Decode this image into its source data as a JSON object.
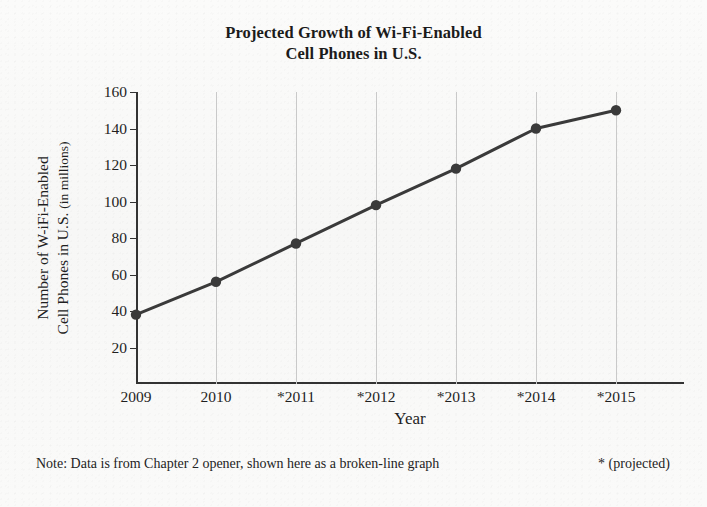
{
  "chart_data": {
    "type": "line",
    "title": "Projected Growth of Wi-Fi-Enabled Cell Phones in U.S.",
    "title_lines": [
      "Projected Growth of Wi-Fi-Enabled",
      "Cell Phones in U.S."
    ],
    "xlabel": "Year",
    "ylabel": "Number of W-iFi-Enabled Cell Phones in U.S. (in millions)",
    "ylabel_lines": [
      "Number of W-iFi-Enabled",
      "Cell Phones in U.S. (in millions)"
    ],
    "ylabel_line2_main": "Cell Phones in U.S.",
    "ylabel_line2_small": "(in millions)",
    "categories": [
      "2009",
      "2010",
      "*2011",
      "*2012",
      "*2013",
      "*2014",
      "*2015"
    ],
    "values": [
      38,
      56,
      77,
      98,
      118,
      140,
      150
    ],
    "ylim": [
      0,
      160
    ],
    "yticks": [
      160,
      140,
      120,
      100,
      80,
      60,
      40,
      20
    ],
    "grid": "vertical",
    "legend": "none",
    "series_color": "#3a3a3a",
    "grid_color": "#c9c9c9",
    "axis_color": "#333333"
  },
  "footnote": {
    "note": "Note: Data is from Chapter 2 opener, shown here as a broken-line graph",
    "key": "* (projected)"
  }
}
